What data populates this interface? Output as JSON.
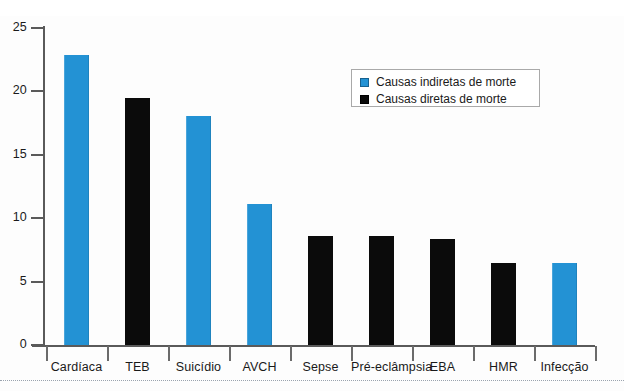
{
  "chart_data": {
    "type": "bar",
    "title": "",
    "subtitle": "",
    "xlabel": "",
    "ylabel": "",
    "ylim": [
      0,
      25
    ],
    "yticks": [
      0,
      5,
      10,
      15,
      20,
      25
    ],
    "ytick_labels": [
      "0",
      "5",
      "10",
      "15",
      "20",
      "25"
    ],
    "grid": false,
    "legend_position": "top-right",
    "categories": [
      "Cardíaca",
      "TEB",
      "Suicídio",
      "AVCH",
      "Sepse",
      "Pré-eclâmpsia",
      "EBA",
      "HMR",
      "Infecção"
    ],
    "values": [
      22.9,
      19.5,
      18.1,
      11.1,
      8.6,
      8.6,
      8.4,
      6.5,
      6.5
    ],
    "bar_colors": [
      "#2392d4",
      "#0b0b0b",
      "#2392d4",
      "#2392d4",
      "#0b0b0b",
      "#0b0b0b",
      "#0b0b0b",
      "#0b0b0b",
      "#2392d4"
    ],
    "bar_series": [
      "indiretas",
      "diretas",
      "indiretas",
      "indiretas",
      "diretas",
      "diretas",
      "diretas",
      "diretas",
      "indiretas"
    ],
    "series": [
      {
        "name": "Causas indiretas de morte",
        "color": "#2392d4",
        "points": [
          {
            "category": "Cardíaca",
            "value": 22.9
          },
          {
            "category": "Suicídio",
            "value": 18.1
          },
          {
            "category": "AVCH",
            "value": 11.1
          },
          {
            "category": "Infecção",
            "value": 6.5
          }
        ]
      },
      {
        "name": "Causas diretas de morte",
        "color": "#0b0b0b",
        "points": [
          {
            "category": "TEB",
            "value": 19.5
          },
          {
            "category": "Sepse",
            "value": 8.6
          },
          {
            "category": "Pré-eclâmpsia",
            "value": 8.6
          },
          {
            "category": "EBA",
            "value": 8.4
          },
          {
            "category": "HMR",
            "value": 6.5
          }
        ]
      }
    ],
    "legend": [
      {
        "label": "Causas indiretas de morte",
        "color": "#2392d4",
        "marker": "square-blue-swatch"
      },
      {
        "label": "Causas diretas de morte",
        "color": "#0b0b0b",
        "marker": "square-black-swatch"
      }
    ]
  }
}
